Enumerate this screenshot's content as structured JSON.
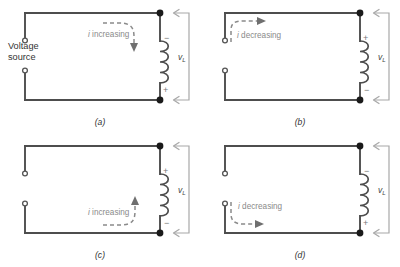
{
  "figure": {
    "source_label_line1": "Voltage",
    "source_label_line2": "source",
    "voltage_symbol": "v",
    "voltage_subscript": "L",
    "colors": {
      "wire": "#4d4d4d",
      "node": "#1a1a1a",
      "annotation_gray": "#8a8a8a",
      "loop_arrow_gray": "#a8a8a8",
      "text": "#333333"
    }
  },
  "panels": [
    {
      "id": "a",
      "caption": "(a)",
      "current_label": "i increasing",
      "current_label_i": "i",
      "current_label_rest": " increasing",
      "arrow_position": "top-right",
      "arrow_direction": "down",
      "polarity_top": "−",
      "polarity_bottom": "+",
      "shows_source_label": true,
      "voltage_label": "v",
      "voltage_sub": "L"
    },
    {
      "id": "b",
      "caption": "(b)",
      "current_label": "i decreasing",
      "current_label_i": "i",
      "current_label_rest": " decreasing",
      "arrow_position": "top-left",
      "arrow_direction": "right",
      "polarity_top": "+",
      "polarity_bottom": "−",
      "shows_source_label": false,
      "voltage_label": "v",
      "voltage_sub": "L"
    },
    {
      "id": "c",
      "caption": "(c)",
      "current_label": "i increasing",
      "current_label_i": "i",
      "current_label_rest": " increasing",
      "arrow_position": "bottom-right",
      "arrow_direction": "up",
      "polarity_top": "+",
      "polarity_bottom": "−",
      "shows_source_label": false,
      "voltage_label": "v",
      "voltage_sub": "L"
    },
    {
      "id": "d",
      "caption": "(d)",
      "current_label": "i decreasing",
      "current_label_i": "i",
      "current_label_rest": " decreasing",
      "arrow_position": "bottom-left",
      "arrow_direction": "right",
      "polarity_top": "−",
      "polarity_bottom": "+",
      "shows_source_label": false,
      "voltage_label": "v",
      "voltage_sub": "L"
    }
  ]
}
